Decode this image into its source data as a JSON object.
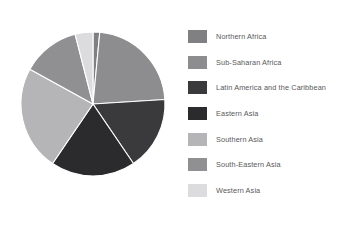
{
  "chart_data": {
    "type": "pie",
    "title": "",
    "subtitle": "",
    "xlabel": "",
    "ylabel": "",
    "grid": false,
    "legend_position": "right",
    "start_angle_deg": 0,
    "direction": "clockwise",
    "categories": [
      "Northern Africa",
      "Sub-Saharan Africa",
      "Latin America and the Caribbean",
      "Eastern Asia",
      "Southern Asia",
      "South-Eastern Asia",
      "Western Asia"
    ],
    "values": [
      1.5,
      22.5,
      16.5,
      19.0,
      23.5,
      13.0,
      4.0
    ],
    "unit": "percent",
    "colors": [
      "#808082",
      "#8d8d8f",
      "#3a3a3c",
      "#2b2b2d",
      "#b5b5b7",
      "#909092",
      "#dcdcde"
    ],
    "slices": [
      {
        "label": "Northern Africa",
        "value": 1.5,
        "color": "#808082",
        "start_deg": 0.0,
        "end_deg": 5.4
      },
      {
        "label": "Sub-Saharan Africa",
        "value": 22.5,
        "color": "#8d8d8f",
        "start_deg": 5.4,
        "end_deg": 86.4
      },
      {
        "label": "Latin America and the Caribbean",
        "value": 16.5,
        "color": "#3a3a3c",
        "start_deg": 86.4,
        "end_deg": 145.8
      },
      {
        "label": "Eastern Asia",
        "value": 19.0,
        "color": "#2b2b2d",
        "start_deg": 145.8,
        "end_deg": 214.2
      },
      {
        "label": "Southern Asia",
        "value": 23.5,
        "color": "#b5b5b7",
        "start_deg": 214.2,
        "end_deg": 298.8
      },
      {
        "label": "South-Eastern Asia",
        "value": 13.0,
        "color": "#909092",
        "start_deg": 298.8,
        "end_deg": 345.6
      },
      {
        "label": "Western Asia",
        "value": 4.0,
        "color": "#dcdcde",
        "start_deg": 345.6,
        "end_deg": 360.0
      }
    ],
    "geometry": {
      "center_x": 93,
      "center_y": 104,
      "radius": 72
    }
  },
  "legend": {
    "items": [
      {
        "label": "Northern Africa",
        "color": "#808082"
      },
      {
        "label": "Sub-Saharan Africa",
        "color": "#8d8d8f"
      },
      {
        "label": "Latin America and the Caribbean",
        "color": "#3a3a3c"
      },
      {
        "label": "Eastern Asia",
        "color": "#2b2b2d"
      },
      {
        "label": "Southern Asia",
        "color": "#b5b5b7"
      },
      {
        "label": "South-Eastern Asia",
        "color": "#909092"
      },
      {
        "label": "Western Asia",
        "color": "#dcdcde"
      }
    ]
  },
  "style": {
    "background": "#ffffff",
    "label_color": "#58585a",
    "slice_stroke": "#ffffff"
  }
}
